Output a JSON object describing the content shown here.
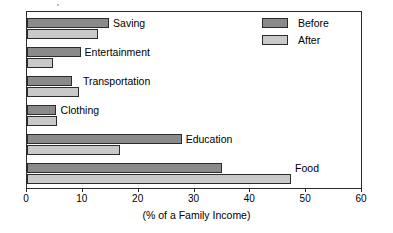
{
  "chart_data": {
    "type": "bar",
    "orientation": "horizontal",
    "title": "",
    "xlabel": "(% of a Family Income)",
    "ylabel": "",
    "xlim": [
      0,
      60
    ],
    "xticks": [
      0,
      10,
      20,
      30,
      40,
      50,
      60
    ],
    "grid": false,
    "legend_position": "top-right",
    "categories": [
      "Saving",
      "Entertainment",
      "Transportation",
      "Clothing",
      "Education",
      "Food"
    ],
    "series": [
      {
        "name": "Before",
        "color": "#8a8a8a",
        "values": [
          14.7,
          9.6,
          8,
          5.2,
          27.7,
          35
        ]
      },
      {
        "name": "After",
        "color": "#c9c9c9",
        "values": [
          12.7,
          4.6,
          9.3,
          5.3,
          16.6,
          47.3
        ]
      }
    ]
  },
  "axis": {
    "tick_labels": [
      "0",
      "10",
      "20",
      "30",
      "40",
      "50",
      "60"
    ],
    "title": "(% of a Family Income)"
  },
  "legend": {
    "items": [
      {
        "label": "Before",
        "color": "#8a8a8a"
      },
      {
        "label": "After",
        "color": "#c9c9c9"
      }
    ]
  },
  "category_labels": [
    "Saving",
    "Entertainment",
    "Transportation",
    "Clothing",
    "Education",
    "Food"
  ]
}
